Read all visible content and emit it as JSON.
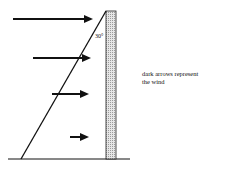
{
  "diagram": {
    "angle_label": "30°",
    "legend_text": "dark arrows represent the wind",
    "legend_line1": "dark arrows represent",
    "legend_line2": "the wind",
    "colors": {
      "line": "#111111",
      "pole_fill": "#d9d9d9",
      "background": "#ffffff"
    },
    "arrows": [
      {
        "y": 19,
        "x1": 13,
        "x2": 92
      },
      {
        "y": 58,
        "x1": 33,
        "x2": 90
      },
      {
        "y": 94,
        "x1": 52,
        "x2": 88
      },
      {
        "y": 137,
        "x1": 70,
        "x2": 88
      }
    ]
  }
}
